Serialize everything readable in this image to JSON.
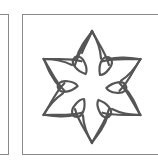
{
  "tiles": [
    {
      "name": "previous-tile",
      "partial": true
    },
    {
      "name": "knot-tile",
      "partial": true,
      "icon": "six-petal-knot-icon"
    }
  ],
  "colors": {
    "frame_border": "#8a8a8a",
    "stroke": "#555555",
    "background": "#ffffff"
  }
}
